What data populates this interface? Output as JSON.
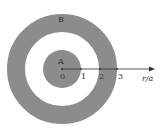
{
  "diagram": {
    "colors": {
      "fill": "#8c8c8c",
      "background": "#ffffff",
      "axis": "#333333"
    },
    "regions": [
      {
        "id": "A",
        "label": "A",
        "description": "inner solid disk, 0 ≤ r ≤ a"
      },
      {
        "id": "B",
        "label": "B",
        "description": "outer annulus, 2a ≤ r ≤ 3a"
      }
    ],
    "axis": {
      "label": "r/a",
      "ticks": [
        "0",
        "1",
        "2",
        "3"
      ]
    }
  }
}
